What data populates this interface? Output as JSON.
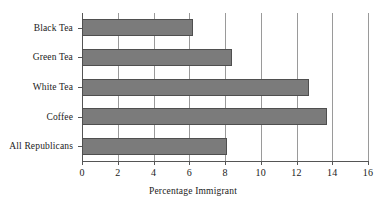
{
  "chart_data": {
    "type": "bar",
    "orientation": "horizontal",
    "title": "",
    "xlabel": "Percentage Immigrant",
    "ylabel": "",
    "categories": [
      "Black Tea",
      "Green Tea",
      "White Tea",
      "Coffee",
      "All Republicans"
    ],
    "values": [
      6.2,
      8.4,
      12.7,
      13.7,
      8.1
    ],
    "xlim": [
      0,
      16
    ],
    "xticks": [
      0,
      2,
      4,
      6,
      8,
      10,
      12,
      14,
      16
    ],
    "xtick_labels": [
      "0",
      "2",
      "4",
      "6",
      "8",
      "10",
      "12",
      "14",
      "16"
    ],
    "grid": "vertical",
    "legend": null,
    "bar_color": "#7b7b7b",
    "bar_edge_color": "#4f4f4f",
    "background_color": "#ffffff",
    "axis_color": "#555555",
    "gridline_color": "#9a9a9a"
  }
}
